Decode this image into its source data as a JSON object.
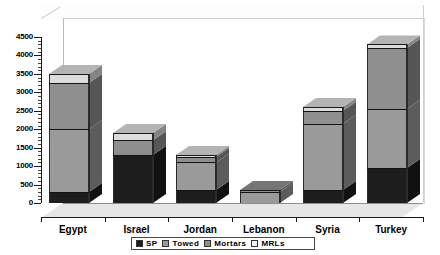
{
  "chart_data": {
    "type": "bar",
    "subtype": "stacked-3d-column",
    "title": "",
    "subtitle": "",
    "xlabel": "",
    "ylabel": "",
    "categories": [
      "Egypt",
      "Israel",
      "Jordan",
      "Lebanon",
      "Syria",
      "Turkey"
    ],
    "series": [
      {
        "name": "SP",
        "color": "#1d1d1d",
        "values": [
          300,
          1300,
          350,
          0,
          350,
          950
        ]
      },
      {
        "name": "Towed",
        "color": "#9a9a9a",
        "values": [
          1700,
          0,
          750,
          300,
          1800,
          1600
        ]
      },
      {
        "name": "Mortars",
        "color": "#8f8f8f",
        "values": [
          1250,
          400,
          150,
          50,
          350,
          1650
        ]
      },
      {
        "name": "MRLs",
        "color": "#dcdcdc",
        "values": [
          250,
          200,
          50,
          0,
          100,
          100
        ]
      }
    ],
    "totals": [
      3500,
      1900,
      1300,
      350,
      2600,
      4300
    ],
    "ylim": [
      0,
      4500
    ],
    "yticks": [
      0,
      500,
      1000,
      1500,
      2000,
      2500,
      3000,
      3500,
      4000,
      4500
    ],
    "ytick_labels": [
      "0",
      "500",
      "1000",
      "1500",
      "2000",
      "2500",
      "3000",
      "3500",
      "4000",
      "4500"
    ],
    "y_minor_interval": 100,
    "grid": false,
    "legend_position": "bottom",
    "legend_entries": [
      "SP",
      "Towed",
      "Mortars",
      "MRLs"
    ]
  },
  "legend": {
    "items": [
      {
        "label": "SP",
        "color": "#1d1d1d"
      },
      {
        "label": "Towed",
        "color": "#9a9a9a"
      },
      {
        "label": "Mortars",
        "color": "#8f8f8f"
      },
      {
        "label": "MRLs",
        "color": "#f2f2f2"
      }
    ]
  },
  "colors": {
    "plot_background": "#ffffff",
    "floor": "#e6e6e6",
    "axis": "#1a1a1a",
    "bar_outline": "#2b2b2b"
  }
}
